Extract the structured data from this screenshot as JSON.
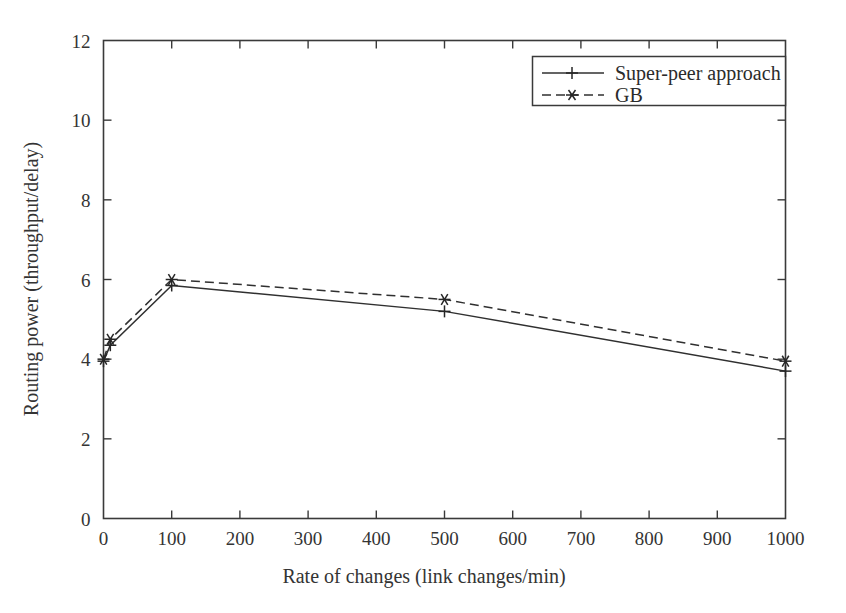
{
  "chart_data": {
    "type": "line",
    "title": "",
    "xlabel": "Rate of changes (link changes/min)",
    "ylabel": "Routing power (throughput/delay)",
    "xlim": [
      0,
      1000
    ],
    "ylim": [
      0,
      12
    ],
    "xticks": [
      0,
      100,
      200,
      300,
      400,
      500,
      600,
      700,
      800,
      900,
      1000
    ],
    "xticklabels": [
      "0",
      "100",
      "200",
      "300",
      "400",
      "500",
      "600",
      "700",
      "800",
      "900",
      "1000"
    ],
    "yticks": [
      0,
      2,
      4,
      6,
      8,
      10,
      12
    ],
    "yticklabels": [
      "0",
      "2",
      "4",
      "6",
      "8",
      "10",
      "12"
    ],
    "grid": false,
    "legend_position": "top-right",
    "x": [
      0,
      10,
      100,
      500,
      1000
    ],
    "series": [
      {
        "name": "Super-peer approach",
        "marker": "plus",
        "linestyle": "solid",
        "color": "#303030",
        "values": [
          3.95,
          4.35,
          5.85,
          5.2,
          3.7
        ]
      },
      {
        "name": "GB",
        "marker": "asterisk",
        "linestyle": "dashed",
        "color": "#303030",
        "values": [
          4.0,
          4.5,
          6.0,
          5.5,
          3.95
        ]
      }
    ]
  },
  "legend": {
    "entries": [
      {
        "label": "Super-peer approach"
      },
      {
        "label": "GB"
      }
    ]
  },
  "axes": {
    "x_axis_title": "Rate of changes (link changes/min)",
    "y_axis_title": "Routing power (throughput/delay)"
  }
}
